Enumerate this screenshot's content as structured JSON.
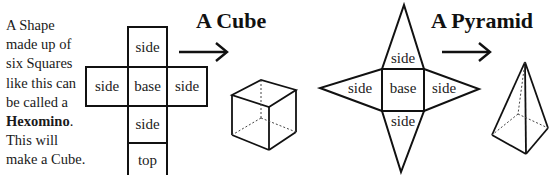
{
  "intro": {
    "line1": "A Shape",
    "line2": "made up of",
    "line3": "six Squares",
    "line4": "like this can",
    "line5": "be called a",
    "term": "Hexomino",
    "term_suffix": ".",
    "line7": "This will",
    "line8": "make a Cube."
  },
  "cube_section": {
    "title": "A Cube",
    "net": {
      "top_side": "side",
      "left_side": "side",
      "base": "base",
      "right_side": "side",
      "bottom_side": "side",
      "top": "top"
    }
  },
  "pyramid_section": {
    "title": "A Pyramid",
    "net": {
      "top_side": "side",
      "left_side": "side",
      "base": "base",
      "right_side": "side",
      "bottom_side": "side"
    }
  },
  "colors": {
    "stroke": "#111111",
    "background": "#ffffff"
  }
}
